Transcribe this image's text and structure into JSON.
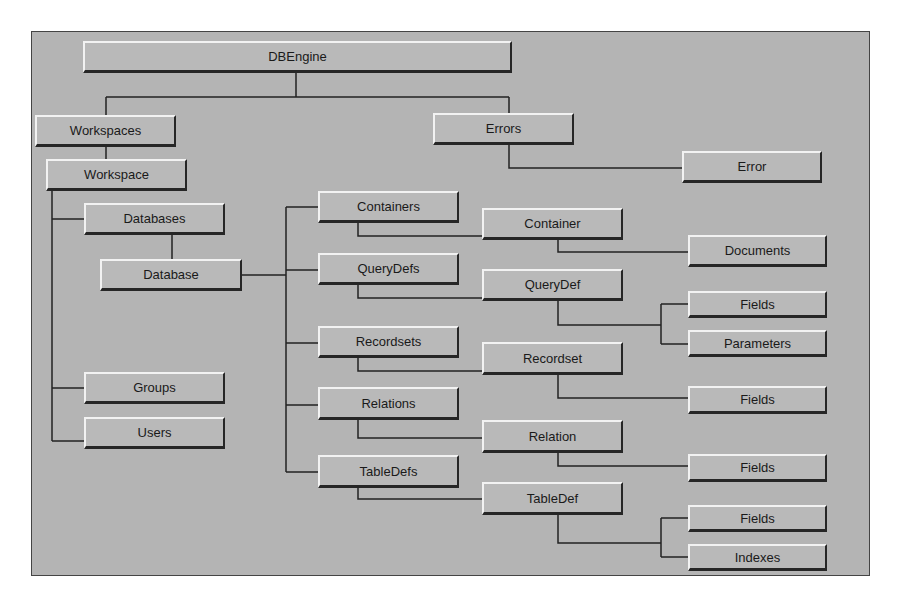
{
  "diagram": {
    "colors": {
      "background": "#b4b4b4",
      "box": "#b9b9b9",
      "line": "#222222"
    },
    "nodes": [
      {
        "id": "dbengine",
        "label": "DBEngine",
        "x": 83,
        "y": 41,
        "w": 429,
        "h": 32
      },
      {
        "id": "workspaces",
        "label": "Workspaces",
        "x": 35,
        "y": 115,
        "w": 141,
        "h": 32
      },
      {
        "id": "workspace",
        "label": "Workspace",
        "x": 46,
        "y": 159,
        "w": 141,
        "h": 32
      },
      {
        "id": "errors",
        "label": "Errors",
        "x": 433,
        "y": 113,
        "w": 141,
        "h": 32
      },
      {
        "id": "error",
        "label": "Error",
        "x": 682,
        "y": 151,
        "w": 140,
        "h": 32
      },
      {
        "id": "databases",
        "label": "Databases",
        "x": 84,
        "y": 203,
        "w": 141,
        "h": 32
      },
      {
        "id": "database",
        "label": "Database",
        "x": 100,
        "y": 259,
        "w": 142,
        "h": 32
      },
      {
        "id": "groups",
        "label": "Groups",
        "x": 84,
        "y": 372,
        "w": 141,
        "h": 32
      },
      {
        "id": "users",
        "label": "Users",
        "x": 84,
        "y": 417,
        "w": 141,
        "h": 32
      },
      {
        "id": "containers",
        "label": "Containers",
        "x": 318,
        "y": 191,
        "w": 141,
        "h": 32
      },
      {
        "id": "querydefs",
        "label": "QueryDefs",
        "x": 318,
        "y": 253,
        "w": 141,
        "h": 32
      },
      {
        "id": "recordsets",
        "label": "Recordsets",
        "x": 318,
        "y": 326,
        "w": 141,
        "h": 32
      },
      {
        "id": "relations",
        "label": "Relations",
        "x": 318,
        "y": 387,
        "w": 141,
        "h": 33
      },
      {
        "id": "tabledefs",
        "label": "TableDefs",
        "x": 318,
        "y": 455,
        "w": 141,
        "h": 33
      },
      {
        "id": "container",
        "label": "Container",
        "x": 482,
        "y": 208,
        "w": 141,
        "h": 32
      },
      {
        "id": "querydef",
        "label": "QueryDef",
        "x": 482,
        "y": 269,
        "w": 141,
        "h": 32
      },
      {
        "id": "recordset",
        "label": "Recordset",
        "x": 482,
        "y": 342,
        "w": 141,
        "h": 33
      },
      {
        "id": "relation",
        "label": "Relation",
        "x": 482,
        "y": 420,
        "w": 141,
        "h": 33
      },
      {
        "id": "tabledef",
        "label": "TableDef",
        "x": 482,
        "y": 482,
        "w": 141,
        "h": 33
      },
      {
        "id": "documents",
        "label": "Documents",
        "x": 688,
        "y": 235,
        "w": 139,
        "h": 32
      },
      {
        "id": "qd-fields",
        "label": "Fields",
        "x": 688,
        "y": 291,
        "w": 139,
        "h": 27
      },
      {
        "id": "parameters",
        "label": "Parameters",
        "x": 688,
        "y": 330,
        "w": 139,
        "h": 27
      },
      {
        "id": "rs-fields",
        "label": "Fields",
        "x": 688,
        "y": 386,
        "w": 139,
        "h": 28
      },
      {
        "id": "rel-fields",
        "label": "Fields",
        "x": 688,
        "y": 454,
        "w": 139,
        "h": 28
      },
      {
        "id": "td-fields",
        "label": "Fields",
        "x": 688,
        "y": 505,
        "w": 139,
        "h": 27
      },
      {
        "id": "indexes",
        "label": "Indexes",
        "x": 688,
        "y": 544,
        "w": 139,
        "h": 27
      }
    ],
    "edges": [
      {
        "from": "dbengine",
        "to": "workspaces"
      },
      {
        "from": "dbengine",
        "to": "errors"
      },
      {
        "from": "workspaces",
        "to": "workspace"
      },
      {
        "from": "errors",
        "to": "error"
      },
      {
        "from": "workspace",
        "to": "databases"
      },
      {
        "from": "workspace",
        "to": "groups"
      },
      {
        "from": "workspace",
        "to": "users"
      },
      {
        "from": "databases",
        "to": "database"
      },
      {
        "from": "database",
        "to": "containers"
      },
      {
        "from": "database",
        "to": "querydefs"
      },
      {
        "from": "database",
        "to": "recordsets"
      },
      {
        "from": "database",
        "to": "relations"
      },
      {
        "from": "database",
        "to": "tabledefs"
      },
      {
        "from": "containers",
        "to": "container"
      },
      {
        "from": "querydefs",
        "to": "querydef"
      },
      {
        "from": "recordsets",
        "to": "recordset"
      },
      {
        "from": "relations",
        "to": "relation"
      },
      {
        "from": "tabledefs",
        "to": "tabledef"
      },
      {
        "from": "container",
        "to": "documents"
      },
      {
        "from": "querydef",
        "to": "qd-fields"
      },
      {
        "from": "querydef",
        "to": "parameters"
      },
      {
        "from": "recordset",
        "to": "rs-fields"
      },
      {
        "from": "relation",
        "to": "rel-fields"
      },
      {
        "from": "tabledef",
        "to": "td-fields"
      },
      {
        "from": "tabledef",
        "to": "indexes"
      }
    ],
    "connector_paths": [
      "M296 73 V97 M106 97 H509 M106 97 V115 M509 97 V113",
      "M106 147 V159",
      "M509 145 V168 H682",
      "M52 191 V441 M52 219 H84 M52 388 H84 M52 441 H84",
      "M172 235 V259",
      "M242 275 H286 M286 207 V472 M286 207 H318 M286 270 H318 M286 343 H318 M286 405 H318 M286 472 H318",
      "M358 223 V236 H482",
      "M358 285 V298 H482",
      "M358 358 V371 H482",
      "M358 420 V438 H482",
      "M358 488 V499 H482",
      "M558 240 V252 H688",
      "M558 301 V325 H661 M661 304 V344 M661 304 H688 M661 344 H688",
      "M558 375 V398 H688",
      "M558 453 V466 H688",
      "M558 515 V543 H661 M661 518 V557 M661 518 H688 M661 557 H688"
    ]
  }
}
